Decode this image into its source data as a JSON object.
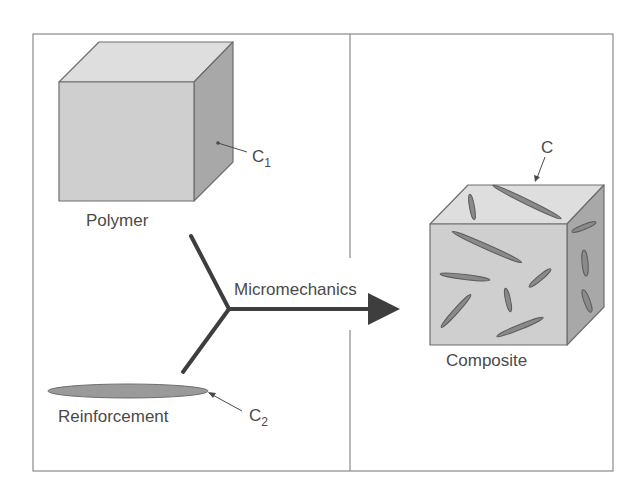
{
  "diagram": {
    "type": "micromechanics-schematic",
    "colors": {
      "frame": "#8a8a8a",
      "cube_front": "#cfcfcf",
      "cube_top": "#dedede",
      "cube_side": "#a8a8a8",
      "fiber": "#8a8a8a",
      "arrow": "#3e3e3e",
      "text": "#4a4a4a"
    },
    "left_panel": {
      "polymer": {
        "label": "Polymer",
        "property_symbol": "C",
        "property_subscript": "1"
      },
      "reinforcement": {
        "label": "Reinforcement",
        "property_symbol": "C",
        "property_subscript": "2"
      }
    },
    "process": {
      "label": "Micromechanics"
    },
    "right_panel": {
      "composite": {
        "label": "Composite",
        "property_symbol": "C"
      }
    }
  }
}
